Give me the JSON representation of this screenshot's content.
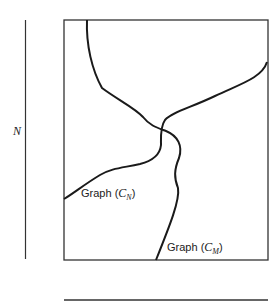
{
  "diagram": {
    "axis_label": "N",
    "graphs": [
      {
        "id": "cn",
        "prefix": "Graph (",
        "symbol": "C",
        "subscript": "N",
        "suffix": ")"
      },
      {
        "id": "cm",
        "prefix": "Graph (",
        "symbol": "C",
        "subscript": "M",
        "suffix": ")"
      }
    ],
    "colors": {
      "line": "#1a1a1a",
      "frame": "#333333"
    }
  }
}
